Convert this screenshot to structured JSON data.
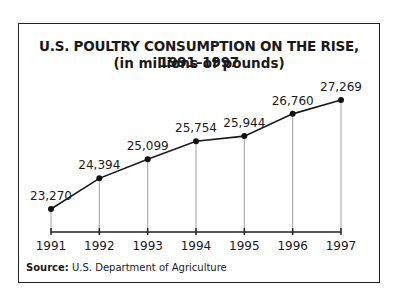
{
  "chart_data": {
    "type": "line",
    "title": "U.S. POULTRY CONSUMPTION ON THE RISE, 1991–1997",
    "subtitle": "(in millions of pounds)",
    "categories": [
      "1991",
      "1992",
      "1993",
      "1994",
      "1995",
      "1996",
      "1997"
    ],
    "series": [
      {
        "name": "Poultry consumption",
        "values": [
          23270,
          24394,
          25099,
          25754,
          25944,
          26760,
          27269
        ]
      }
    ],
    "data_labels": [
      "23,270",
      "24,394",
      "25,099",
      "25,754",
      "25,944",
      "26,760",
      "27,269"
    ],
    "xlabel": "",
    "ylabel": "",
    "ylim": [
      21850,
      28400
    ],
    "grid": false,
    "legend": "none",
    "drop_lines": true
  },
  "source": {
    "label": "Source:",
    "text": " U.S. Department of Agriculture"
  }
}
